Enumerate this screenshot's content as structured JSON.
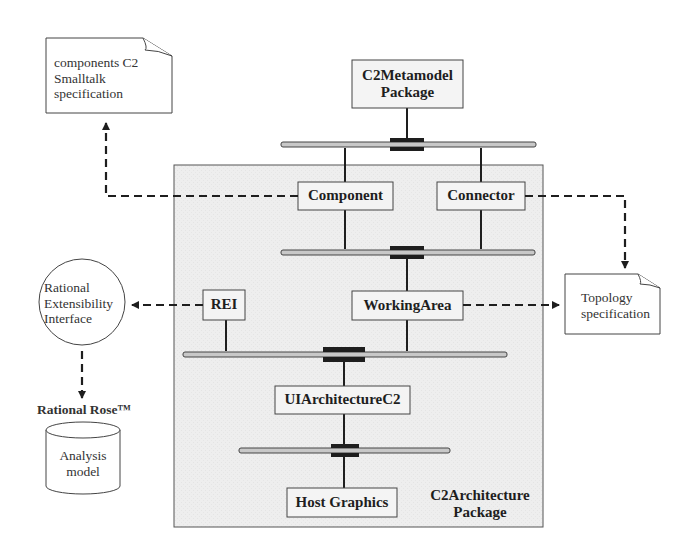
{
  "diagram": {
    "notes": {
      "smalltalk_spec": [
        "components C2",
        "Smalltalk",
        "specification"
      ],
      "topology_spec": [
        "Topology",
        "specification"
      ]
    },
    "packages": {
      "metamodel": [
        "C2Metamodel",
        "Package"
      ],
      "architecture": [
        "C2Architecture",
        "Package"
      ]
    },
    "components": {
      "component": "Component",
      "connector": "Connector",
      "rei": "REI",
      "working_area": "WorkingArea",
      "ui_architecture": "UIArchitectureC2",
      "host_graphics": "Host Graphics"
    },
    "interface_circle": [
      "Rational",
      "Extensibility",
      "Interface"
    ],
    "tool_label": "Rational Rose™",
    "datastore": [
      "Analysis",
      "model"
    ],
    "colors": {
      "line": "#1e1e1e",
      "package_fill": "#efefef",
      "box_fill": "#f4f4f4",
      "bus_fill": "#c8c8c8"
    }
  }
}
